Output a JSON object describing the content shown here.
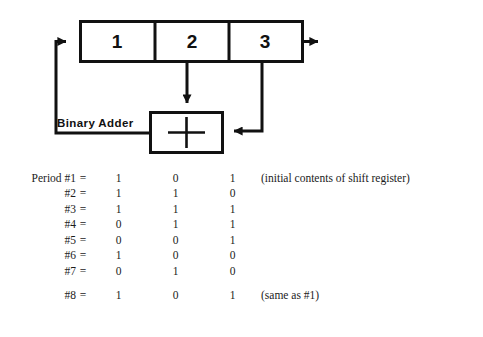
{
  "diagram": {
    "register": {
      "name": "shift-register",
      "cells": [
        {
          "label": "1"
        },
        {
          "label": "2"
        },
        {
          "label": "3"
        }
      ]
    },
    "adder": {
      "label": "Binary Adder",
      "symbol": "+"
    }
  },
  "sequence": {
    "period_prefix": "Period",
    "equals": "=",
    "rows": [
      {
        "period": "Period #1",
        "bits": [
          "1",
          "0",
          "1"
        ],
        "note": "(initial contents of shift register)",
        "gap_before": false
      },
      {
        "period": "#2",
        "bits": [
          "1",
          "1",
          "0"
        ],
        "note": "",
        "gap_before": false
      },
      {
        "period": "#3",
        "bits": [
          "1",
          "1",
          "1"
        ],
        "note": "",
        "gap_before": false
      },
      {
        "period": "#4",
        "bits": [
          "0",
          "1",
          "1"
        ],
        "note": "",
        "gap_before": false
      },
      {
        "period": "#5",
        "bits": [
          "0",
          "0",
          "1"
        ],
        "note": "",
        "gap_before": false
      },
      {
        "period": "#6",
        "bits": [
          "1",
          "0",
          "0"
        ],
        "note": "",
        "gap_before": false
      },
      {
        "period": "#7",
        "bits": [
          "0",
          "1",
          "0"
        ],
        "note": "",
        "gap_before": false
      },
      {
        "period": "#8",
        "bits": [
          "1",
          "0",
          "1"
        ],
        "note": "(same as #1)",
        "gap_before": true
      }
    ]
  },
  "colors": {
    "ink": "#111111",
    "text": "#1b1b1b",
    "background": "#ffffff"
  }
}
